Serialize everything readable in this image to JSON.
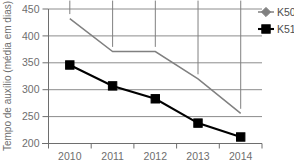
{
  "chart_data": {
    "type": "line",
    "title": "",
    "xlabel": "",
    "ylabel": "Tempo de auxílio (média em dias)",
    "categories": [
      "2010",
      "2011",
      "2012",
      "2013",
      "2014"
    ],
    "x_ticks": [
      "2010",
      "2011",
      "2012",
      "2013",
      "2014"
    ],
    "y_ticks": [
      "200",
      "250",
      "300",
      "350",
      "400",
      "450"
    ],
    "ylim": [
      200,
      450
    ],
    "grid": "horizontal",
    "legend_position": "top-right",
    "series": [
      {
        "name": "K50",
        "color": "#808080",
        "marker": "diamond",
        "values": [
          432,
          371,
          371,
          320,
          256
        ]
      },
      {
        "name": "K51",
        "color": "#000000",
        "marker": "square",
        "values": [
          346,
          307,
          283,
          238,
          212
        ]
      }
    ]
  },
  "legend": {
    "items": [
      {
        "label": "K50"
      },
      {
        "label": "K51"
      }
    ]
  },
  "colors": {
    "series_k50": "#808080",
    "series_k51": "#000000",
    "gridline": "#8c8c8c",
    "axis": "#6e6e6e",
    "text": "#6e6e6e",
    "background": "#ffffff"
  }
}
